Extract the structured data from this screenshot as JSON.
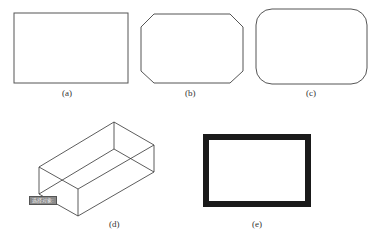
{
  "figure": {
    "panels": [
      {
        "id": "a",
        "label": "(a)",
        "shape": "rectangle"
      },
      {
        "id": "b",
        "label": "(b)",
        "shape": "chamfered-rectangle"
      },
      {
        "id": "c",
        "label": "(c)",
        "shape": "filleted-rectangle"
      },
      {
        "id": "d",
        "label": "(d)",
        "shape": "3d-rectangular-box"
      },
      {
        "id": "e",
        "label": "(e)",
        "shape": "thick-rectangle"
      }
    ],
    "tooltip": {
      "text": "选择对象:"
    },
    "colors": {
      "line": "#555555",
      "thick": "#1a1a1a",
      "tooltip_bg": "#8a8a8a"
    }
  }
}
